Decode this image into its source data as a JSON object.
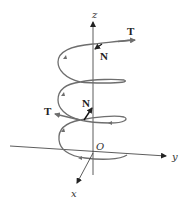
{
  "figure": {
    "axes": {
      "x_label": "x",
      "y_label": "y",
      "z_label": "z",
      "origin_label": "O"
    },
    "vectors": [
      {
        "name": "tangent-top",
        "label": "T"
      },
      {
        "name": "normal-top",
        "label": "N"
      },
      {
        "name": "normal-middle",
        "label": "N"
      },
      {
        "name": "tangent-middle",
        "label": "T"
      }
    ],
    "colors": {
      "curve": "#6e6e6e",
      "axis": "#222222",
      "vector": "#111111"
    }
  }
}
